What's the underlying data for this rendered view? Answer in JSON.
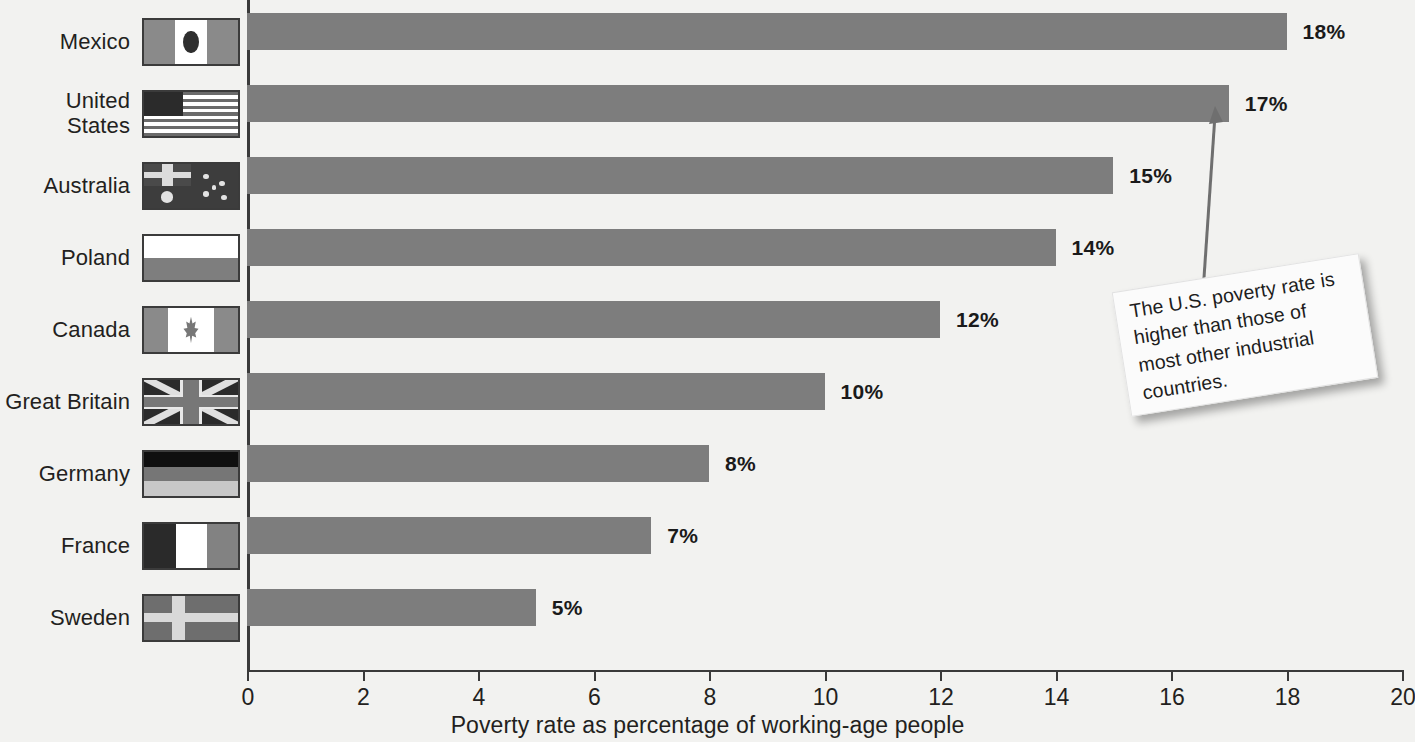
{
  "chart_data": {
    "type": "bar",
    "orientation": "horizontal",
    "title": "",
    "xlabel": "Poverty rate as percentage of working-age people",
    "ylabel": "",
    "xlim": [
      0,
      20
    ],
    "xticks": [
      "0",
      "2",
      "4",
      "6",
      "8",
      "10",
      "12",
      "14",
      "16",
      "18",
      "20"
    ],
    "grid": false,
    "legend": "none",
    "categories": [
      "Mexico",
      "United States",
      "Australia",
      "Poland",
      "Canada",
      "Great Britain",
      "Germany",
      "France",
      "Sweden"
    ],
    "values": [
      18,
      17,
      15,
      14,
      12,
      10,
      8,
      7,
      5
    ],
    "value_labels": [
      "18%",
      "17%",
      "15%",
      "14%",
      "12%",
      "10%",
      "8%",
      "7%",
      "5%"
    ],
    "bar_color": "#7d7d7d",
    "annotations": [
      {
        "text": "The U.S. poverty rate is higher than those of most other industrial countries.",
        "points_to": "United States"
      }
    ]
  },
  "rows": [
    {
      "label": "Mexico",
      "value": 18,
      "value_label": "18%",
      "flag": "mexico"
    },
    {
      "label": "United\nStates",
      "value": 17,
      "value_label": "17%",
      "flag": "united-states"
    },
    {
      "label": "Australia",
      "value": 15,
      "value_label": "15%",
      "flag": "australia"
    },
    {
      "label": "Poland",
      "value": 14,
      "value_label": "14%",
      "flag": "poland"
    },
    {
      "label": "Canada",
      "value": 12,
      "value_label": "12%",
      "flag": "canada"
    },
    {
      "label": "Great Britain",
      "value": 10,
      "value_label": "10%",
      "flag": "great-britain"
    },
    {
      "label": "Germany",
      "value": 8,
      "value_label": "8%",
      "flag": "germany"
    },
    {
      "label": "France",
      "value": 7,
      "value_label": "7%",
      "flag": "france"
    },
    {
      "label": "Sweden",
      "value": 5,
      "value_label": "5%",
      "flag": "sweden"
    }
  ],
  "axis": {
    "label": "Poverty rate as percentage of working-age people",
    "ticks": [
      "0",
      "2",
      "4",
      "6",
      "8",
      "10",
      "12",
      "14",
      "16",
      "18",
      "20"
    ]
  },
  "callout": {
    "text": "The U.S. poverty rate is higher than those of most other industrial countries."
  },
  "colors": {
    "background": "#f2f2f0",
    "bar": "#7d7d7d",
    "axis": "#3a3a3a",
    "text": "#231f20"
  }
}
